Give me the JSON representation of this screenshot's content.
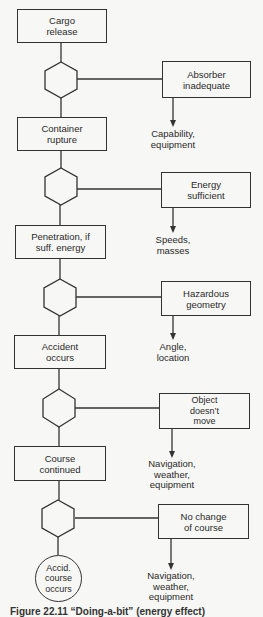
{
  "diagram": {
    "type": "flowchart",
    "main_steps": [
      {
        "label": "Cargo\nrelease"
      },
      {
        "label": "Container\nrupture"
      },
      {
        "label": "Penetration, if\nsuff. energy"
      },
      {
        "label": "Accident\noccurs"
      },
      {
        "label": "Course\ncontinued"
      }
    ],
    "conditions": [
      {
        "label": "Absorber\ninadequate",
        "factors": "Capability,\nequipment"
      },
      {
        "label": "Energy\nsufficient",
        "factors": "Speeds,\nmasses"
      },
      {
        "label": "Hazardous\ngeometry",
        "factors": "Angle,\nlocation"
      },
      {
        "label": "Object\ndoesn’t\nmove",
        "factors": "Navigation,\nweather,\nequipment"
      },
      {
        "label": "No change\nof course",
        "factors": "Navigation,\nweather,\nequipment"
      }
    ],
    "end_event": {
      "label": "Accid.\ncourse\noccurs"
    },
    "gate_shape": "hexagon (AND gate)",
    "caption": "Figure 22.11 “Doing-a-bit” (energy effect)"
  }
}
